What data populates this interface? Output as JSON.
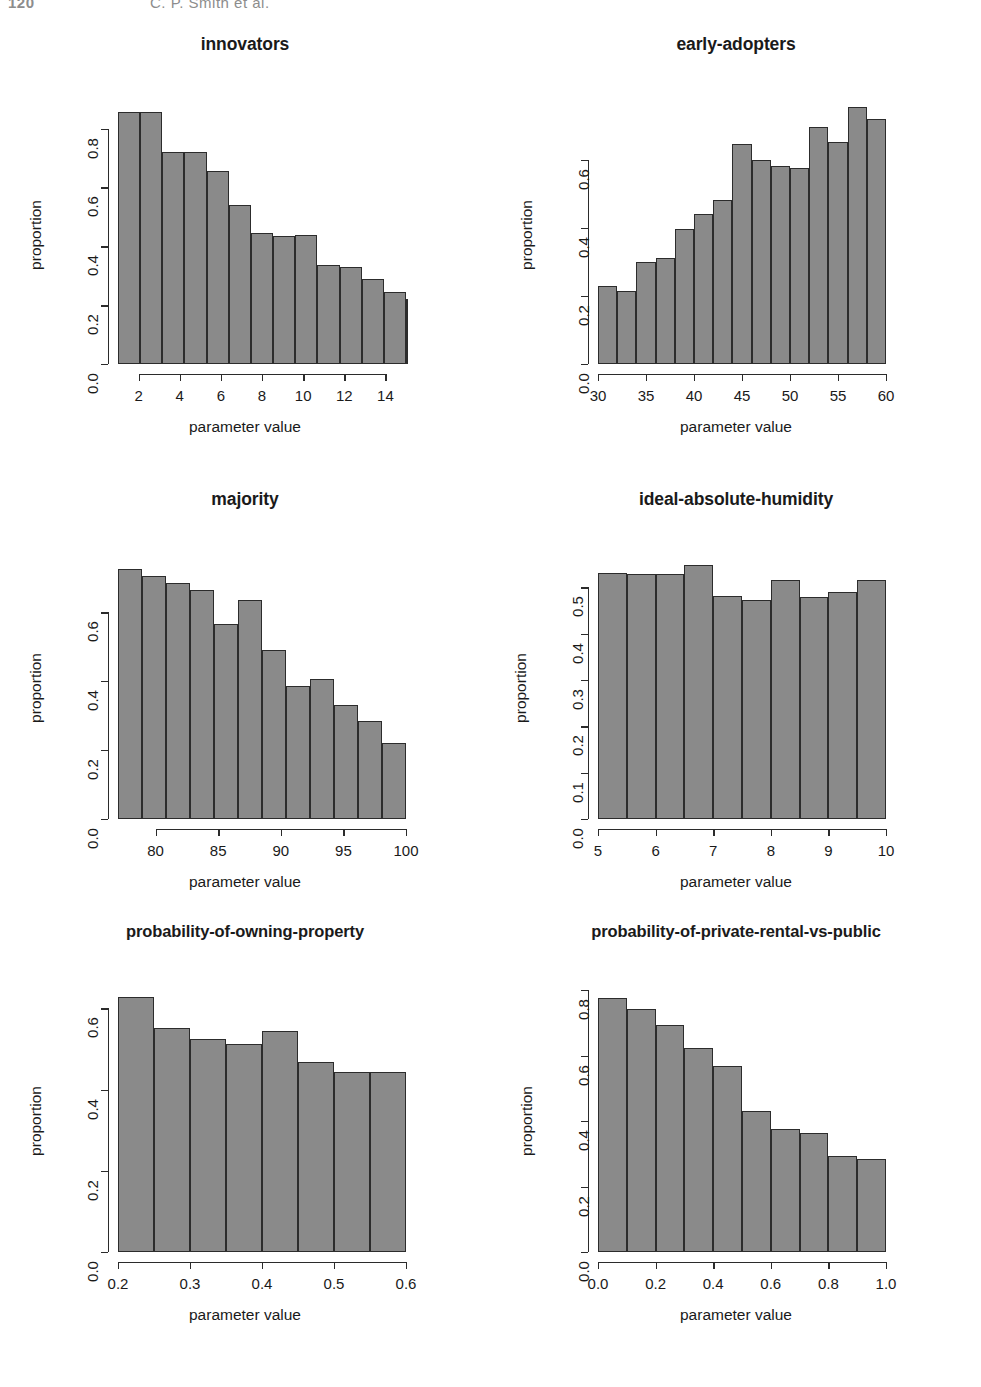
{
  "page_header": {
    "folio": "120",
    "running_head": "C. P. Smith et al."
  },
  "common": {
    "xlabel": "parameter value",
    "ylabel": "proportion",
    "bar_fill": "#8a8a8a",
    "bar_stroke": "#2c2c2c",
    "axis_color": "#2b2b2b"
  },
  "chart_data": [
    {
      "type": "bar",
      "title": "innovators",
      "xlabel": "parameter value",
      "ylabel": "proportion",
      "xlim": [
        1,
        15
      ],
      "ylim": [
        0,
        0.88
      ],
      "xticks": [
        2,
        4,
        6,
        8,
        10,
        12,
        14
      ],
      "xticklabels": [
        "2",
        "4",
        "6",
        "8",
        "10",
        "12",
        "14"
      ],
      "yticks": [
        0.0,
        0.2,
        0.4,
        0.6,
        0.8
      ],
      "yticklabels": [
        "0.0",
        "0.2",
        "0.4",
        "0.6",
        "0.8"
      ],
      "bin_edges": [
        1.0,
        2.077,
        3.154,
        4.231,
        5.308,
        6.385,
        7.462,
        8.538,
        9.615,
        10.692,
        11.769,
        12.846,
        13.923,
        15.0
      ],
      "values": [
        0.855,
        0.855,
        0.72,
        0.72,
        0.655,
        0.54,
        0.445,
        0.435,
        0.44,
        0.335,
        0.33,
        0.29,
        0.245,
        0.22
      ],
      "n_bars": 13,
      "grid": false,
      "legend": false
    },
    {
      "type": "bar",
      "title": "early-adopters",
      "xlabel": "parameter value",
      "ylabel": "proportion",
      "xlim": [
        30,
        60
      ],
      "ylim": [
        0,
        0.76
      ],
      "xticks": [
        30,
        35,
        40,
        45,
        50,
        55,
        60
      ],
      "xticklabels": [
        "30",
        "35",
        "40",
        "45",
        "50",
        "55",
        "60"
      ],
      "yticks": [
        0.0,
        0.2,
        0.4,
        0.6
      ],
      "yticklabels": [
        "0.0",
        "0.2",
        "0.4",
        "0.6"
      ],
      "bin_edges": [
        30,
        32,
        34,
        36,
        38,
        40,
        42,
        44,
        46,
        48,
        50,
        52,
        54,
        56,
        58,
        60
      ],
      "values": [
        0.23,
        0.215,
        0.3,
        0.31,
        0.395,
        0.44,
        0.48,
        0.645,
        0.6,
        0.58,
        0.575,
        0.695,
        0.65,
        0.755,
        0.72
      ],
      "n_bars": 15,
      "grid": false,
      "legend": false
    },
    {
      "type": "bar",
      "title": "majority",
      "xlabel": "parameter value",
      "ylabel": "proportion",
      "xlim": [
        77,
        100
      ],
      "ylim": [
        0,
        0.76
      ],
      "xticks": [
        80,
        85,
        90,
        95,
        100
      ],
      "xticklabels": [
        "80",
        "85",
        "90",
        "95",
        "100"
      ],
      "yticks": [
        0.0,
        0.2,
        0.4,
        0.6
      ],
      "yticklabels": [
        "0.0",
        "0.2",
        "0.4",
        "0.6"
      ],
      "bin_edges": [
        77.0,
        78.92,
        80.83,
        82.75,
        84.67,
        86.58,
        88.5,
        90.42,
        92.33,
        94.25,
        96.17,
        98.08,
        100.0
      ],
      "values": [
        0.725,
        0.705,
        0.685,
        0.665,
        0.565,
        0.635,
        0.49,
        0.385,
        0.405,
        0.33,
        0.285,
        0.22
      ],
      "n_bars": 12,
      "grid": false,
      "legend": false
    },
    {
      "type": "bar",
      "title": "ideal-absolute-humidity",
      "xlabel": "parameter value",
      "ylabel": "proportion",
      "xlim": [
        5,
        10
      ],
      "ylim": [
        0,
        0.565
      ],
      "xticks": [
        5,
        6,
        7,
        8,
        9,
        10
      ],
      "xticklabels": [
        "5",
        "6",
        "7",
        "8",
        "9",
        "10"
      ],
      "yticks": [
        0.0,
        0.1,
        0.2,
        0.3,
        0.4,
        0.5
      ],
      "yticklabels": [
        "0.0",
        "0.1",
        "0.2",
        "0.3",
        "0.4",
        "0.5"
      ],
      "bin_edges": [
        5.0,
        5.5,
        6.0,
        6.5,
        7.0,
        7.5,
        8.0,
        8.5,
        9.0,
        9.5,
        10.0
      ],
      "values": [
        0.53,
        0.528,
        0.528,
        0.548,
        0.481,
        0.472,
        0.515,
        0.478,
        0.49,
        0.515
      ],
      "n_bars": 10,
      "grid": false,
      "legend": false
    },
    {
      "type": "bar",
      "title": "probability-of-owning-property",
      "xlabel": "parameter value",
      "ylabel": "proportion",
      "xlim": [
        0.2,
        0.6
      ],
      "ylim": [
        0,
        0.645
      ],
      "xticks": [
        0.2,
        0.3,
        0.4,
        0.5,
        0.6
      ],
      "xticklabels": [
        "0.2",
        "0.3",
        "0.4",
        "0.5",
        "0.6"
      ],
      "yticks": [
        0.0,
        0.2,
        0.4,
        0.6
      ],
      "yticklabels": [
        "0.0",
        "0.2",
        "0.4",
        "0.6"
      ],
      "bin_edges": [
        0.2,
        0.25,
        0.3,
        0.35,
        0.4,
        0.45,
        0.5,
        0.55,
        0.6
      ],
      "values": [
        0.628,
        0.551,
        0.525,
        0.511,
        0.545,
        0.468,
        0.444,
        0.444
      ],
      "n_bars": 8,
      "grid": false,
      "legend": false
    },
    {
      "type": "bar",
      "title": "probability-of-private-rental-vs-public",
      "xlabel": "parameter value",
      "ylabel": "proportion",
      "xlim": [
        0.0,
        1.0
      ],
      "ylim": [
        0,
        0.8
      ],
      "xticks": [
        0.0,
        0.2,
        0.4,
        0.6,
        0.8,
        1.0
      ],
      "xticklabels": [
        "0.0",
        "0.2",
        "0.4",
        "0.6",
        "0.8",
        "1.0"
      ],
      "yticks": [
        0.0,
        0.2,
        0.4,
        0.6,
        0.8
      ],
      "yticklabels": [
        "0.0",
        "0.2",
        "0.4",
        "0.6",
        "0.8"
      ],
      "bin_edges": [
        0.0,
        0.1,
        0.2,
        0.3,
        0.4,
        0.5,
        0.6,
        0.7,
        0.8,
        0.9,
        1.0
      ],
      "values": [
        0.775,
        0.743,
        0.693,
        0.622,
        0.568,
        0.432,
        0.375,
        0.364,
        0.292,
        0.283
      ],
      "n_bars": 10,
      "grid": false,
      "legend": false
    }
  ]
}
